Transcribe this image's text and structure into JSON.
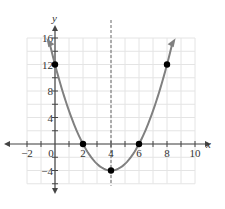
{
  "chart_data": {
    "type": "line",
    "title": "",
    "xlabel": "x",
    "ylabel": "y",
    "xlim": [
      -2,
      10
    ],
    "ylim": [
      -6,
      16
    ],
    "grid": true,
    "x_ticks": [
      -2,
      0,
      2,
      4,
      6,
      8,
      10
    ],
    "x_tick_labels": [
      "−2",
      "0",
      "2",
      "4",
      "6",
      "8",
      "10"
    ],
    "y_ticks": [
      -4,
      4,
      8,
      12,
      16
    ],
    "y_tick_labels": [
      "−4",
      "4",
      "8",
      "12",
      "16"
    ],
    "series": [
      {
        "name": "parabola y = (x − 4)² − 4",
        "equation": "y = x^2 - 8x + 12",
        "x_range": [
          -0.4,
          8.4
        ],
        "color": "#808080"
      }
    ],
    "points": [
      {
        "x": 0,
        "y": 12
      },
      {
        "x": 2,
        "y": 0
      },
      {
        "x": 4,
        "y": -4
      },
      {
        "x": 6,
        "y": 0
      },
      {
        "x": 8,
        "y": 12
      }
    ],
    "axis_of_symmetry": {
      "x": 4,
      "style": "dashed"
    },
    "colors": {
      "curve": "#808080",
      "points": "#000000",
      "grid": "#e4e4e4",
      "axis": "#444444"
    }
  }
}
